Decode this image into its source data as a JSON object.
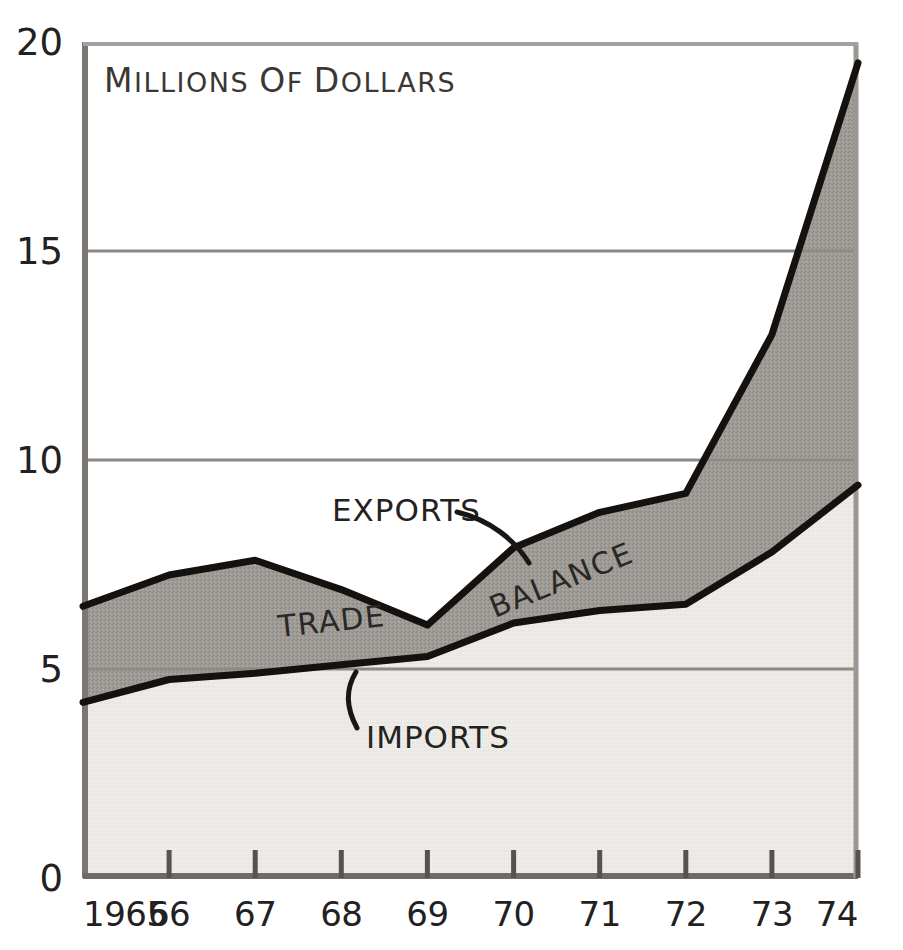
{
  "chart_data": {
    "type": "area",
    "title": "Millions of Dollars",
    "title_caps": [
      "M",
      "D"
    ],
    "xlabel": "",
    "ylabel": "",
    "x": [
      1965,
      1966,
      1967,
      1968,
      1969,
      1970,
      1971,
      1972,
      1973,
      1974
    ],
    "categories": [
      "1965",
      "66",
      "67",
      "68",
      "69",
      "70",
      "71",
      "72",
      "73",
      "74"
    ],
    "xtick_labels": [
      "1965",
      "66",
      "67",
      "68",
      "69",
      "70",
      "71",
      "72",
      "73",
      "74"
    ],
    "ytick_labels": [
      "0",
      "5",
      "10",
      "15",
      "20"
    ],
    "ytick_values": [
      0,
      5,
      10,
      15,
      20
    ],
    "ylim": [
      0,
      20
    ],
    "xlim": [
      1965,
      1974
    ],
    "grid": true,
    "grid_axis": "y",
    "legend_position": "inline-annotations",
    "series": [
      {
        "name": "EXPORTS",
        "values": [
          6.5,
          7.25,
          7.6,
          6.9,
          6.05,
          7.9,
          8.75,
          9.2,
          13.0,
          19.5
        ],
        "fill": "#9b9893",
        "stroke": "#14110f"
      },
      {
        "name": "IMPORTS",
        "values": [
          4.2,
          4.75,
          4.9,
          5.1,
          5.3,
          6.1,
          6.4,
          6.55,
          7.8,
          9.4
        ],
        "fill": "#eceae6",
        "stroke": "#14110f"
      }
    ],
    "band_fill_label": "BALANCE",
    "annotations": [
      {
        "name": "trade",
        "text": "TRADE",
        "x": 1967.9,
        "y": 5.9,
        "rotation": -6
      },
      {
        "name": "balance",
        "text": "BALANCE",
        "x": 1970.6,
        "y": 6.9,
        "rotation": -22
      },
      {
        "name": "exports",
        "text": "EXPORTS",
        "x": 1969.0,
        "y": 8.2,
        "rotation": 0,
        "leader": true
      },
      {
        "name": "imports",
        "text": "IMPORTS",
        "x": 1968.3,
        "y": 3.5,
        "rotation": 0,
        "leader": true
      }
    ]
  },
  "colors": {
    "balance_band_fill": "#9b9893",
    "imports_area_fill": "#eceae6",
    "curve_stroke": "#14110f",
    "gridline": "#8d8a86",
    "axis_line": "#6e6b67",
    "background": "#ffffff",
    "text": "#23211f"
  },
  "geometry": {
    "plot_left": 83,
    "plot_right": 858,
    "plot_top": 42,
    "plot_bottom": 878
  }
}
